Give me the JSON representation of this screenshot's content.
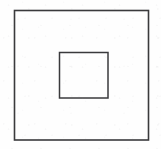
{
  "figure": {
    "background_color": "#fefefe",
    "stroke_color": "#3a3a3c",
    "fill_color": "none",
    "canvas": {
      "width": 161,
      "height": 149
    },
    "shapes": [
      {
        "name": "outer-square",
        "type": "rect",
        "x": 14.5,
        "y": 10.5,
        "width": 134,
        "height": 129.5,
        "stroke_width": 1.6,
        "stroke_color": "#3a3a3c",
        "fill": "none"
      },
      {
        "name": "inner-square",
        "type": "rect",
        "x": 59.5,
        "y": 52.5,
        "width": 48.5,
        "height": 45.5,
        "stroke_width": 1.5,
        "stroke_color": "#3a3a3c",
        "fill": "none"
      }
    ]
  },
  "chart_data": {
    "type": "diagram",
    "title": "",
    "subtitle": "",
    "xlabel": "",
    "ylabel": "",
    "legend": [],
    "annotations": [],
    "elements": [
      {
        "label": "outer square",
        "x": 14.5,
        "y": 10.5,
        "w": 134,
        "h": 129.5
      },
      {
        "label": "inner square",
        "x": 59.5,
        "y": 52.5,
        "w": 48.5,
        "h": 45.5
      }
    ]
  }
}
